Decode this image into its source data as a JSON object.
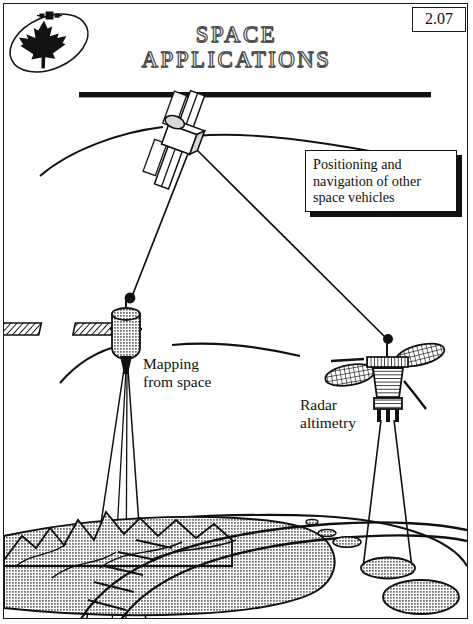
{
  "page": {
    "number": "2.07",
    "width": 473,
    "height": 624,
    "background": "#ffffff",
    "ink": "#111111"
  },
  "header": {
    "logo_name": "canadian-space-agency-maple-leaf-logo",
    "title_line1": "SPACE",
    "title_line2": "APPLICATIONS",
    "rule": true
  },
  "callout": {
    "text": "Positioning and navigation of other space vehicles"
  },
  "labels": {
    "mapping": "Mapping\nfrom space",
    "radar": "Radar\naltimetry"
  },
  "diagram": {
    "type": "technical-illustration",
    "subject": "space applications",
    "elements": [
      {
        "name": "navigation-satellite",
        "role": "positioning and navigation beacon",
        "position": "top-center",
        "features": [
          "solar-panels",
          "orbital-arc",
          "downlink-signal-lines"
        ]
      },
      {
        "name": "mapping-satellite",
        "role": "mapping from space",
        "position": "mid-left",
        "features": [
          "hatched-solar-panels",
          "cylindrical-body",
          "antenna-ball",
          "sensor-cone",
          "swath-beam"
        ]
      },
      {
        "name": "radar-altimetry-satellite",
        "role": "radar altimetry",
        "position": "mid-right",
        "features": [
          "elliptical-dish-antennas",
          "striped-conical-body",
          "antenna-mast",
          "legs",
          "beam-cone"
        ]
      },
      {
        "name": "terrain",
        "role": "earth surface",
        "position": "bottom",
        "features": [
          "mountain-range",
          "landmass",
          "horizon-curve",
          "mapping-swath-ladder",
          "radar-footprint-ellipses"
        ]
      }
    ],
    "colors": {
      "terrain_fill": "#9a9a9a",
      "satellite_body": "#a8a8a8",
      "outline": "#111111"
    }
  }
}
